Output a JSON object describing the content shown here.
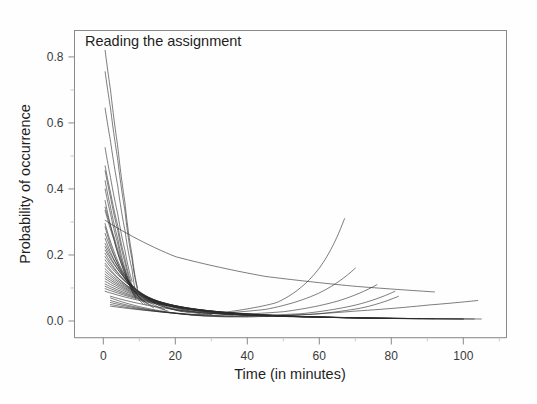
{
  "figure": {
    "panel_title": "Reading the assignment",
    "background_color": "#fefefe",
    "frame_color": "#8a8a8a",
    "curve_color": "#2b2b2b"
  },
  "chart_data": {
    "type": "line",
    "title": "Reading the assignment",
    "xlabel": "Time (in minutes)",
    "ylabel": "Probability of occurrence",
    "xlim": [
      -8,
      112
    ],
    "ylim": [
      -0.05,
      0.88
    ],
    "xticks": [
      0,
      20,
      40,
      60,
      80,
      100
    ],
    "xtick_labels": [
      "0",
      "20",
      "40",
      "60",
      "80",
      "100"
    ],
    "xminor_ticks": [
      10,
      30,
      50,
      70,
      90,
      110
    ],
    "yticks": [
      0.0,
      0.2,
      0.4,
      0.6,
      0.8
    ],
    "ytick_labels": [
      "0.0",
      "0.2",
      "0.4",
      "0.6",
      "0.8"
    ],
    "yminor_ticks": [
      0.1,
      0.3,
      0.5,
      0.7
    ],
    "grid": false,
    "legend": false,
    "series_count": 40,
    "series": [
      {
        "name": "curve-01",
        "x": [
          0.5,
          2,
          4,
          6,
          8,
          9.5
        ],
        "values": [
          0.82,
          0.7,
          0.53,
          0.36,
          0.2,
          0.1
        ]
      },
      {
        "name": "curve-02",
        "x": [
          0.5,
          2,
          4,
          6,
          8,
          9.5
        ],
        "values": [
          0.755,
          0.645,
          0.49,
          0.335,
          0.185,
          0.095
        ]
      },
      {
        "name": "curve-03",
        "x": [
          0.5,
          2,
          4,
          6,
          8,
          9
        ],
        "values": [
          0.645,
          0.545,
          0.41,
          0.275,
          0.155,
          0.085
        ]
      },
      {
        "name": "curve-04",
        "x": [
          0.5,
          2,
          4,
          6,
          8
        ],
        "values": [
          0.525,
          0.435,
          0.325,
          0.215,
          0.12
        ]
      },
      {
        "name": "curve-05",
        "x": [
          0.5,
          2,
          4,
          6,
          8
        ],
        "values": [
          0.47,
          0.39,
          0.29,
          0.19,
          0.108
        ]
      },
      {
        "name": "curve-06",
        "x": [
          0.5,
          2,
          4,
          6,
          8
        ],
        "values": [
          0.455,
          0.375,
          0.275,
          0.178,
          0.1
        ]
      },
      {
        "name": "curve-07",
        "x": [
          0.5,
          2,
          4,
          6,
          9
        ],
        "values": [
          0.425,
          0.345,
          0.25,
          0.16,
          0.072
        ]
      },
      {
        "name": "curve-08",
        "x": [
          0.5,
          2,
          4,
          6,
          9
        ],
        "values": [
          0.4,
          0.325,
          0.235,
          0.15,
          0.068
        ]
      },
      {
        "name": "curve-09",
        "x": [
          0.5,
          2,
          5,
          8,
          11
        ],
        "values": [
          0.365,
          0.29,
          0.175,
          0.095,
          0.052
        ]
      },
      {
        "name": "curve-10",
        "x": [
          0.5,
          3,
          6,
          9,
          12
        ],
        "values": [
          0.345,
          0.255,
          0.155,
          0.085,
          0.048
        ]
      },
      {
        "name": "curve-11",
        "x": [
          0.5,
          3,
          6,
          10,
          14
        ],
        "values": [
          0.335,
          0.245,
          0.145,
          0.072,
          0.04
        ]
      },
      {
        "name": "curve-12",
        "x": [
          0.5,
          20,
          45,
          70,
          92
        ],
        "values": [
          0.305,
          0.195,
          0.135,
          0.105,
          0.088
        ]
      },
      {
        "name": "curve-13",
        "x": [
          0.5,
          3,
          7,
          12,
          17
        ],
        "values": [
          0.295,
          0.21,
          0.12,
          0.062,
          0.035
        ]
      },
      {
        "name": "curve-14",
        "x": [
          0.5,
          3,
          7,
          12,
          18
        ],
        "values": [
          0.285,
          0.2,
          0.112,
          0.055,
          0.03
        ]
      },
      {
        "name": "curve-15",
        "x": [
          0.5,
          4,
          9,
          15,
          22
        ],
        "values": [
          0.265,
          0.175,
          0.095,
          0.05,
          0.028
        ]
      },
      {
        "name": "curve-16",
        "x": [
          0.5,
          4,
          9,
          16,
          24
        ],
        "values": [
          0.25,
          0.165,
          0.088,
          0.045,
          0.025
        ]
      },
      {
        "name": "curve-17",
        "x": [
          0.5,
          5,
          11,
          18,
          27
        ],
        "values": [
          0.235,
          0.15,
          0.078,
          0.04,
          0.022
        ]
      },
      {
        "name": "curve-18",
        "x": [
          0.5,
          5,
          12,
          20,
          30
        ],
        "values": [
          0.225,
          0.142,
          0.07,
          0.036,
          0.02
        ]
      },
      {
        "name": "curve-19",
        "x": [
          0.5,
          6,
          14,
          24,
          36
        ],
        "values": [
          0.215,
          0.13,
          0.062,
          0.03,
          0.018
        ]
      },
      {
        "name": "curve-20",
        "x": [
          0.5,
          6,
          15,
          26,
          40
        ],
        "values": [
          0.205,
          0.122,
          0.056,
          0.027,
          0.016
        ]
      },
      {
        "name": "curve-21",
        "x": [
          0.5,
          7,
          17,
          30,
          46
        ],
        "values": [
          0.195,
          0.112,
          0.05,
          0.024,
          0.014
        ]
      },
      {
        "name": "curve-22",
        "x": [
          0.5,
          8,
          19,
          34,
          52
        ],
        "values": [
          0.185,
          0.102,
          0.045,
          0.021,
          0.013
        ]
      },
      {
        "name": "curve-23",
        "x": [
          0.5,
          8,
          20,
          36,
          56
        ],
        "values": [
          0.175,
          0.095,
          0.042,
          0.02,
          0.012
        ]
      },
      {
        "name": "curve-24",
        "x": [
          0.5,
          9,
          22,
          40,
          60
        ],
        "values": [
          0.168,
          0.09,
          0.038,
          0.018,
          0.011
        ]
      },
      {
        "name": "curve-25",
        "x": [
          0.5,
          10,
          25,
          45,
          68
        ],
        "values": [
          0.158,
          0.082,
          0.034,
          0.016,
          0.01
        ]
      },
      {
        "name": "curve-26",
        "x": [
          0.5,
          11,
          27,
          50,
          74
        ],
        "values": [
          0.15,
          0.076,
          0.031,
          0.014,
          0.009
        ]
      },
      {
        "name": "curve-27",
        "x": [
          0.5,
          12,
          30,
          55,
          80
        ],
        "values": [
          0.142,
          0.07,
          0.028,
          0.013,
          0.008
        ]
      },
      {
        "name": "curve-28",
        "x": [
          0.5,
          13,
          32,
          58,
          84
        ],
        "values": [
          0.135,
          0.065,
          0.026,
          0.012,
          0.008
        ]
      },
      {
        "name": "curve-29",
        "x": [
          0.5,
          14,
          35,
          62,
          88
        ],
        "values": [
          0.128,
          0.06,
          0.024,
          0.011,
          0.007
        ]
      },
      {
        "name": "curve-30",
        "x": [
          0.5,
          15,
          38,
          66,
          92
        ],
        "values": [
          0.12,
          0.056,
          0.022,
          0.01,
          0.007
        ]
      },
      {
        "name": "curve-31",
        "x": [
          0.5,
          16,
          40,
          70,
          100
        ],
        "values": [
          0.112,
          0.052,
          0.02,
          0.009,
          0.006
        ]
      },
      {
        "name": "curve-32",
        "x": [
          0.5,
          18,
          44,
          76,
          105
        ],
        "values": [
          0.105,
          0.047,
          0.018,
          0.008,
          0.006
        ]
      },
      {
        "name": "curve-33",
        "x": [
          0.5,
          20,
          48,
          80,
          103
        ],
        "values": [
          0.098,
          0.043,
          0.016,
          0.008,
          0.006
        ]
      },
      {
        "name": "curve-34",
        "x": [
          0.5,
          22,
          52,
          84,
          100
        ],
        "values": [
          0.09,
          0.039,
          0.015,
          0.007,
          0.006
        ]
      },
      {
        "name": "curve-35",
        "x": [
          2,
          30,
          48,
          60,
          67
        ],
        "values": [
          0.075,
          0.022,
          0.055,
          0.16,
          0.31
        ]
      },
      {
        "name": "curve-36",
        "x": [
          2,
          25,
          45,
          60,
          70
        ],
        "values": [
          0.07,
          0.018,
          0.035,
          0.085,
          0.16
        ]
      },
      {
        "name": "curve-37",
        "x": [
          2,
          28,
          50,
          65,
          76
        ],
        "values": [
          0.062,
          0.015,
          0.028,
          0.06,
          0.11
        ]
      },
      {
        "name": "curve-38",
        "x": [
          2,
          32,
          55,
          70,
          81
        ],
        "values": [
          0.056,
          0.013,
          0.022,
          0.048,
          0.09
        ]
      },
      {
        "name": "curve-39",
        "x": [
          2,
          35,
          58,
          72,
          82
        ],
        "values": [
          0.05,
          0.012,
          0.02,
          0.04,
          0.075
        ]
      },
      {
        "name": "curve-40",
        "x": [
          2,
          40,
          70,
          90,
          104
        ],
        "values": [
          0.045,
          0.012,
          0.03,
          0.048,
          0.062
        ]
      }
    ]
  }
}
